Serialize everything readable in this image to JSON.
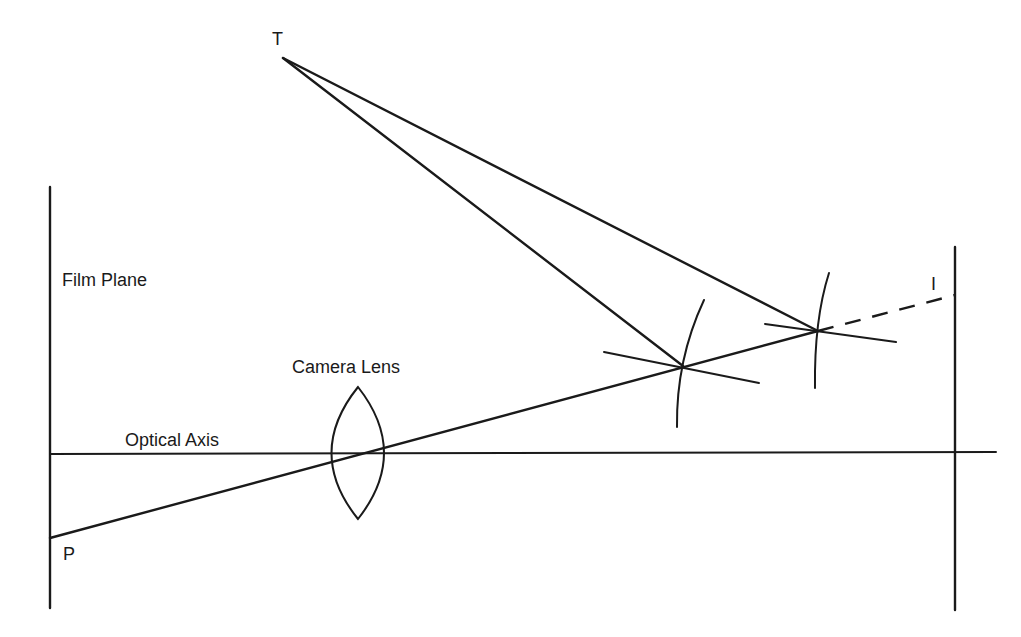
{
  "diagram": {
    "title": "",
    "labels": {
      "target": "T",
      "film_plane": "Film Plane",
      "camera_lens": "Camera Lens",
      "optical_axis": "Optical Axis",
      "point_p": "P",
      "image": "I"
    },
    "colors": {
      "stroke": "#1a1a1a",
      "background": "#ffffff"
    },
    "elements": [
      "film-plane-line",
      "image-plane-line",
      "optical-axis-line",
      "camera-lens",
      "ray-p-to-i",
      "ray-t-to-intersection-1",
      "ray-t-to-intersection-2",
      "intersection-marker-1",
      "intersection-marker-2",
      "dashed-extension-to-i"
    ]
  }
}
